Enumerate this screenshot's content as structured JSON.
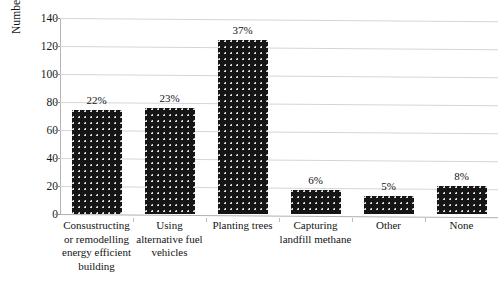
{
  "chart_data": {
    "type": "bar",
    "title": "",
    "subtitle": "",
    "xlabel": "",
    "ylabel": "Number of respondents",
    "ylim": [
      0,
      140
    ],
    "ytick_values": [
      0,
      20,
      40,
      60,
      80,
      100,
      120,
      140
    ],
    "ytick_labels": [
      "0",
      "20",
      "40",
      "60",
      "80",
      "100",
      "120",
      "140"
    ],
    "grid": true,
    "legend": false,
    "legend_position": "none",
    "categories": [
      "Consustructing or remodelling energy efficient building",
      "Using alternative fuel vehicles",
      "Planting trees",
      "Capturing landfill methane",
      "Other",
      "None"
    ],
    "category_lines": [
      [
        "Consustructing",
        "or remodelling",
        "energy efficient",
        "building"
      ],
      [
        "Using",
        "alternative fuel",
        "vehicles"
      ],
      [
        "Planting trees"
      ],
      [
        "Capturing",
        "landfill methane"
      ],
      [
        "Other"
      ],
      [
        "None"
      ]
    ],
    "values": [
      74,
      76,
      124,
      17,
      13,
      20
    ],
    "data_labels": [
      "22%",
      "23%",
      "37%",
      "6%",
      "5%",
      "8%"
    ],
    "percentages": [
      22,
      23,
      37,
      6,
      5,
      8
    ],
    "bar_color": "#151515",
    "bar_pattern": "dotted-speckle",
    "gridline_color": "#d5d5d5",
    "background_color": "#ffffff"
  }
}
